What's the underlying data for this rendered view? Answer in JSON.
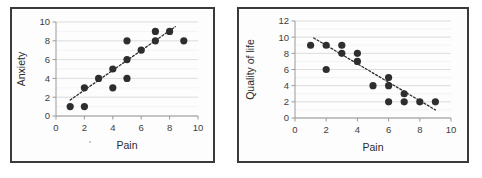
{
  "figure": {
    "panel_count": 2,
    "background_color": "#ffffff",
    "border_color": "#3a3a3a"
  },
  "chart_data": [
    {
      "type": "scatter",
      "title": "",
      "xlabel": "Pain",
      "ylabel": "Anxiety",
      "xlim": [
        0,
        10
      ],
      "ylim": [
        0,
        10
      ],
      "xticks": [
        0,
        2,
        4,
        6,
        8,
        10
      ],
      "yticks": [
        0,
        2,
        4,
        6,
        8,
        10
      ],
      "xtick_labels": [
        "0",
        "2",
        "4",
        "6",
        "8",
        "10"
      ],
      "ytick_labels": [
        "0",
        "2",
        "4",
        "6",
        "8",
        "10"
      ],
      "grid": "horizontal",
      "legend": "none",
      "marker_color": "#2e2e2e",
      "points": [
        {
          "x": 1,
          "y": 1
        },
        {
          "x": 2,
          "y": 1
        },
        {
          "x": 2,
          "y": 3
        },
        {
          "x": 3,
          "y": 4
        },
        {
          "x": 4,
          "y": 3
        },
        {
          "x": 4,
          "y": 5
        },
        {
          "x": 5,
          "y": 4
        },
        {
          "x": 5,
          "y": 6
        },
        {
          "x": 5,
          "y": 8
        },
        {
          "x": 6,
          "y": 7
        },
        {
          "x": 7,
          "y": 8
        },
        {
          "x": 7,
          "y": 9
        },
        {
          "x": 8,
          "y": 9
        },
        {
          "x": 9,
          "y": 8
        }
      ],
      "trendline": {
        "style": "dotted",
        "direction": "positive",
        "x0": 1.0,
        "y0": 1.7,
        "x1": 8.4,
        "y1": 9.5
      }
    },
    {
      "type": "scatter",
      "title": "",
      "xlabel": "Pain",
      "ylabel": "Quality of life",
      "xlim": [
        0,
        10
      ],
      "ylim": [
        0,
        12
      ],
      "xticks": [
        0,
        2,
        4,
        6,
        8,
        10
      ],
      "yticks": [
        0,
        2,
        4,
        6,
        8,
        10,
        12
      ],
      "xtick_labels": [
        "0",
        "2",
        "4",
        "6",
        "8",
        "10"
      ],
      "ytick_labels": [
        "0",
        "2",
        "4",
        "6",
        "8",
        "10",
        "12"
      ],
      "grid": "horizontal",
      "legend": "none",
      "marker_color": "#2e2e2e",
      "points": [
        {
          "x": 1,
          "y": 9
        },
        {
          "x": 2,
          "y": 9
        },
        {
          "x": 2,
          "y": 6
        },
        {
          "x": 3,
          "y": 9
        },
        {
          "x": 3,
          "y": 8
        },
        {
          "x": 4,
          "y": 8
        },
        {
          "x": 4,
          "y": 7
        },
        {
          "x": 5,
          "y": 4
        },
        {
          "x": 6,
          "y": 5
        },
        {
          "x": 6,
          "y": 4
        },
        {
          "x": 6,
          "y": 2
        },
        {
          "x": 7,
          "y": 3
        },
        {
          "x": 7,
          "y": 2
        },
        {
          "x": 8,
          "y": 2
        },
        {
          "x": 9,
          "y": 2
        }
      ],
      "trendline": {
        "style": "dotted",
        "direction": "negative",
        "x0": 1.2,
        "y0": 9.9,
        "x1": 9.0,
        "y1": 1.0
      }
    }
  ]
}
